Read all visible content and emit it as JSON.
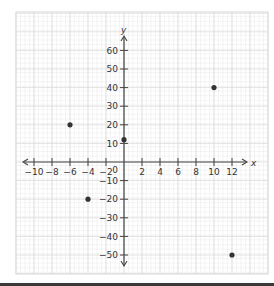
{
  "chart_data": {
    "type": "scatter",
    "title": "",
    "xlabel": "x",
    "ylabel": "y",
    "xlim": [
      -12,
      15
    ],
    "ylim": [
      -58,
      70
    ],
    "x_ticks": [
      -10,
      -8,
      -6,
      -4,
      -2,
      2,
      4,
      6,
      8,
      10,
      12
    ],
    "x_tick_labels": [
      "-10",
      "-8",
      "-6",
      "-4",
      "-2",
      "2",
      "4",
      "6",
      "8",
      "10",
      "12"
    ],
    "y_ticks": [
      60,
      50,
      40,
      30,
      20,
      10,
      -10,
      -20,
      -30,
      -40,
      -50
    ],
    "y_tick_labels": [
      "60",
      "50",
      "40",
      "30",
      "20",
      "10",
      "-10",
      "-20",
      "-30",
      "-40",
      "-50"
    ],
    "origin_label": "0",
    "grid": true,
    "legend": null,
    "series": [
      {
        "name": "points",
        "points": [
          {
            "x": -6,
            "y": 20
          },
          {
            "x": -4,
            "y": -20
          },
          {
            "x": 0,
            "y": 12
          },
          {
            "x": 10,
            "y": 40
          },
          {
            "x": 12,
            "y": -50
          }
        ]
      }
    ]
  },
  "colors": {
    "axis": "#444444",
    "grid_minor": "#ececec",
    "grid_major": "#dcdcdc",
    "point": "#333333",
    "bottom_bar": "#3a3a3a"
  }
}
